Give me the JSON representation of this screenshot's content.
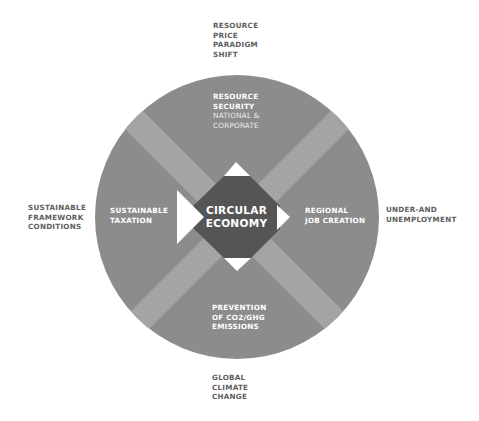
{
  "diagram": {
    "colors": {
      "background": "#ffffff",
      "circle": "#8c8c8c",
      "band": "#a3a3a3",
      "band_overlap": "#b3b3b3",
      "center": "#555555",
      "arrow": "#ffffff",
      "outer_text": "#5e5e5e",
      "inner_text": "#ffffff"
    },
    "center": {
      "line1": "CIRCULAR",
      "line2": "ECONOMY"
    },
    "inner_labels": {
      "top": {
        "line1": "RESOURCE",
        "line2": "SECURITY",
        "sub1": "NATIONAL &",
        "sub2": "CORPORATE"
      },
      "left": {
        "line1": "SUSTAINABLE",
        "line2": "TAXATION"
      },
      "right": {
        "line1": "REGIONAL",
        "line2": "JOB CREATION"
      },
      "bottom": {
        "line1": "PREVENTION",
        "line2": "OF CO2/GHG",
        "line3": "EMISSIONS"
      }
    },
    "outer_labels": {
      "top": {
        "line1": "RESOURCE",
        "line2": "PRICE",
        "line3": "PARADIGM",
        "line4": "SHIFT"
      },
      "left": {
        "line1": "SUSTAINABLE",
        "line2": "FRAMEWORK",
        "line3": "CONDITIONS"
      },
      "right": {
        "line1": "UNDER-AND",
        "line2": "UNEMPLOYMENT"
      },
      "bottom": {
        "line1": "GLOBAL",
        "line2": "CLIMATE",
        "line3": "CHANGE"
      }
    }
  }
}
